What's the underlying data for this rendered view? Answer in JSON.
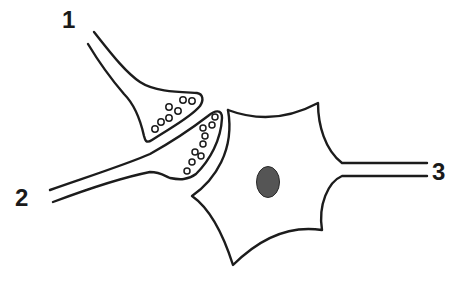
{
  "figure": {
    "labels": [
      {
        "id": "1",
        "text": "1",
        "x": 62,
        "y": 8
      },
      {
        "id": "2",
        "text": "2",
        "x": 15,
        "y": 186
      },
      {
        "id": "3",
        "text": "3",
        "x": 432,
        "y": 160
      }
    ],
    "elements": {
      "presynaptic_terminal_1": {
        "label": "1",
        "vesicle_count": 7
      },
      "presynaptic_terminal_2": {
        "label": "2",
        "vesicle_count": 9
      },
      "postsynaptic_cell": {
        "label": "3",
        "has_nucleus": true,
        "nucleus_color": "#555555"
      }
    },
    "colors": {
      "line": "#1c1c1c",
      "background": "#ffffff",
      "nucleus": "#555555"
    }
  }
}
